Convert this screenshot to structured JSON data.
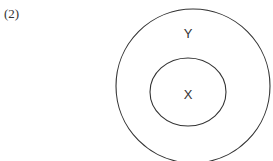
{
  "figure": {
    "label": "(2)"
  },
  "diagram": {
    "type": "venn-subset",
    "outer_set": {
      "label": "Y"
    },
    "inner_set": {
      "label": "X"
    },
    "stroke_color": "#333333",
    "background": "#ffffff"
  }
}
